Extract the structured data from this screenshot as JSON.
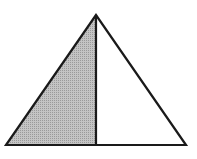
{
  "diagram": {
    "type": "geometry",
    "apex": [
      96,
      15
    ],
    "base_left": [
      6,
      145
    ],
    "base_right": [
      186,
      145
    ],
    "divider_foot": [
      96,
      145
    ],
    "colors": {
      "stroke": "#1a1a1a",
      "shaded_fill": "#b8b8b8",
      "unshaded_fill": "#ffffff",
      "background": "#ffffff"
    }
  }
}
